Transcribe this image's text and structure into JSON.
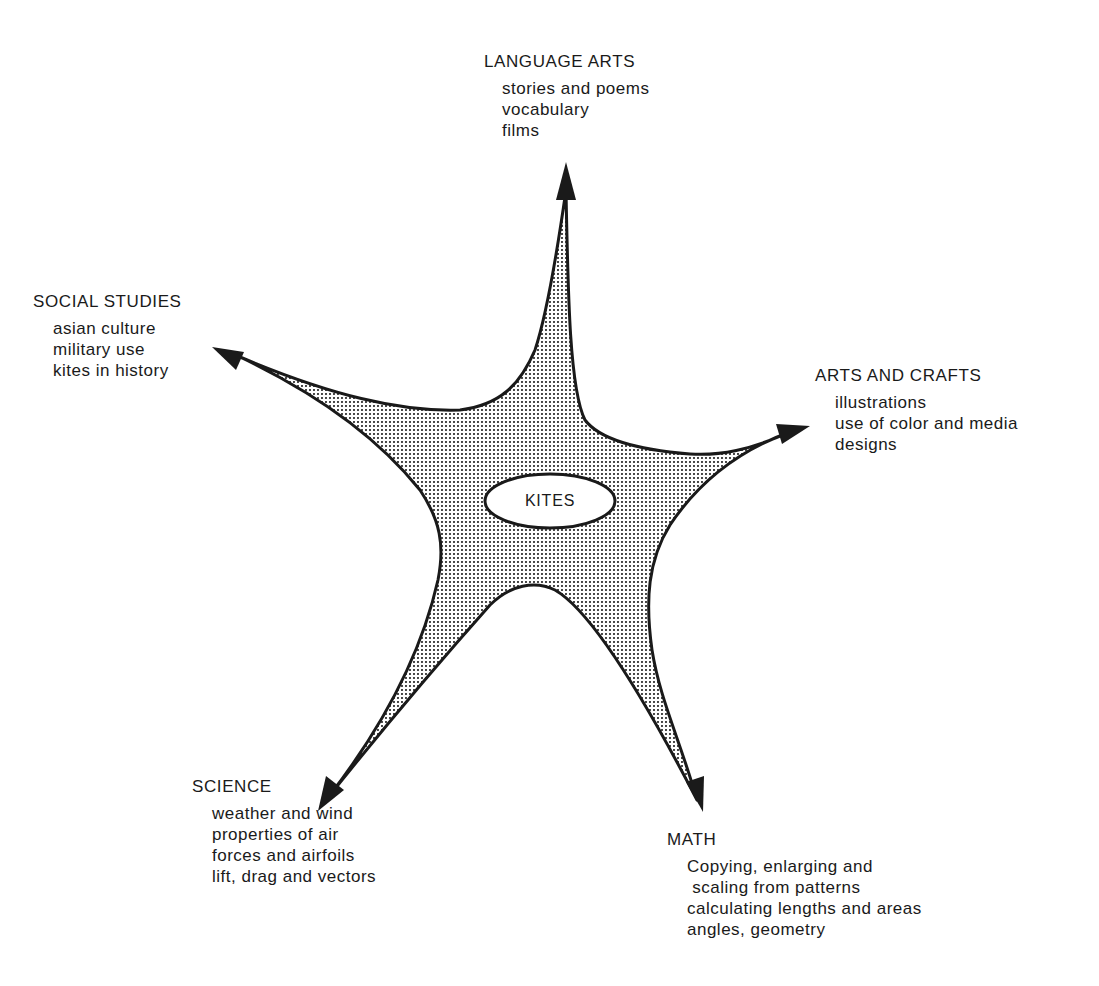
{
  "diagram": {
    "type": "concept-web",
    "center": {
      "label": "KITES"
    },
    "colors": {
      "ink": "#1a1a1a",
      "fill_dots": "#1a1a1a",
      "background": "#ffffff"
    },
    "branches": [
      {
        "id": "language-arts",
        "title": "LANGUAGE ARTS",
        "position": "top",
        "items": [
          "stories and poems",
          "vocabulary",
          "films"
        ]
      },
      {
        "id": "social-studies",
        "title": "SOCIAL STUDIES",
        "position": "upper-left",
        "items": [
          "asian culture",
          "military use",
          "kites in history"
        ]
      },
      {
        "id": "arts-and-crafts",
        "title": "ARTS AND CRAFTS",
        "position": "upper-right",
        "items": [
          "illustrations",
          "use of color and media",
          "designs"
        ]
      },
      {
        "id": "science",
        "title": "SCIENCE",
        "position": "lower-left",
        "items": [
          "weather and wind",
          "properties of air",
          "forces and airfoils",
          "lift, drag and vectors"
        ]
      },
      {
        "id": "math",
        "title": "MATH",
        "position": "lower-right",
        "items": [
          "Copying, enlarging and",
          " scaling from patterns",
          "calculating lengths and areas",
          "angles, geometry"
        ]
      }
    ]
  }
}
